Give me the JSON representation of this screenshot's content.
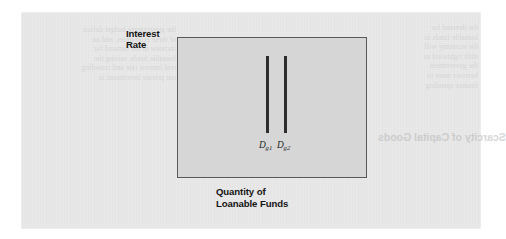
{
  "figure": {
    "y_axis_label_line1": "Interest",
    "y_axis_label_line2": "Rate",
    "x_axis_label_line1": "Quantity of",
    "x_axis_label_line2": "Loanable Funds",
    "curves": [
      {
        "id": "dg1",
        "base": "D",
        "subscript": "g1",
        "x_px": 88,
        "top_px": 18,
        "bottom_px": 95
      },
      {
        "id": "dg2",
        "base": "D",
        "subscript": "g2",
        "x_px": 106,
        "top_px": 18,
        "bottom_px": 95
      }
    ],
    "colors": {
      "page": "#e9e9e9",
      "plot_fill": "#d6d6d6",
      "plot_border": "#57595b",
      "curve": "#2b2d2f",
      "label_text": "#141414"
    }
  },
  "background_bleed": {
    "left_column": "the government budget deficit\nof these economies, and an\nincrease in the demand for\nloanable funds, raising the\nreal interest rate and crowding\nout private investment in",
    "right_column": "the demand for\nloanable funds in\nthe economy will\nshift rightward as\nthe government\nborrows more to\nfinance spending",
    "heading": "Scarcity of Capital Goods"
  }
}
